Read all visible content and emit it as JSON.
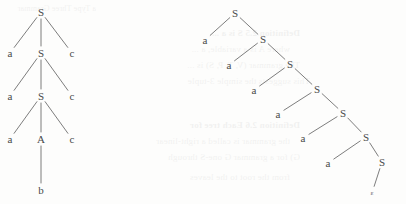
{
  "page": {
    "width": 406,
    "height": 204,
    "background_color": "#fdfdfc",
    "ink_color": "#4a4a4a",
    "stroke_color": "#6e6e6e"
  },
  "bleed_text": {
    "note": "Faint mirrored show-through text from the reverse side of the scanned page",
    "lines": [
      "a Type Three Grammar",
      "Definition 2.5  S is a ...",
      "where A is a variable, a ...",
      "The grammar (V, T, P, S) is ...",
      "This suggests the simple 3-tuple",
      "Definition 2.6  Each tree for",
      "the grammar is called a right-linear",
      "G) for a grammar G one-S through",
      "from the root to the leaves"
    ]
  },
  "figures": [
    {
      "id": "left-tree",
      "name": "ternary-parse-tree",
      "caption": "",
      "root": "S",
      "derivation": [
        "S -> a S c",
        "S -> a S c",
        "S -> a A c",
        "A -> b"
      ],
      "yield": "aaabccc",
      "nodes": [
        {
          "id": "L0",
          "label": "S",
          "x": 41,
          "y": 12,
          "kind": "nonterminal"
        },
        {
          "id": "L1a",
          "label": "a",
          "x": 10,
          "y": 53,
          "kind": "terminal"
        },
        {
          "id": "L1S",
          "label": "S",
          "x": 41,
          "y": 53,
          "kind": "nonterminal"
        },
        {
          "id": "L1c",
          "label": "c",
          "x": 72,
          "y": 53,
          "kind": "terminal"
        },
        {
          "id": "L2a",
          "label": "a",
          "x": 10,
          "y": 96,
          "kind": "terminal"
        },
        {
          "id": "L2S",
          "label": "S",
          "x": 41,
          "y": 96,
          "kind": "nonterminal"
        },
        {
          "id": "L2c",
          "label": "c",
          "x": 72,
          "y": 96,
          "kind": "terminal"
        },
        {
          "id": "L3a",
          "label": "a",
          "x": 10,
          "y": 139,
          "kind": "terminal"
        },
        {
          "id": "L3A",
          "label": "A",
          "x": 41,
          "y": 139,
          "kind": "nonterminal"
        },
        {
          "id": "L3c",
          "label": "c",
          "x": 72,
          "y": 139,
          "kind": "terminal"
        },
        {
          "id": "L4b",
          "label": "b",
          "x": 41,
          "y": 190,
          "kind": "terminal"
        }
      ],
      "edges": [
        [
          "L0",
          "L1a"
        ],
        [
          "L0",
          "L1S"
        ],
        [
          "L0",
          "L1c"
        ],
        [
          "L1S",
          "L2a"
        ],
        [
          "L1S",
          "L2S"
        ],
        [
          "L1S",
          "L2c"
        ],
        [
          "L2S",
          "L3a"
        ],
        [
          "L2S",
          "L3A"
        ],
        [
          "L2S",
          "L3c"
        ],
        [
          "L3A",
          "L4b"
        ]
      ]
    },
    {
      "id": "right-tree",
      "name": "right-linear-parse-tree",
      "caption": "",
      "root": "S",
      "derivation": [
        "S -> a S",
        "S -> a S",
        "S -> a S",
        "S -> a S",
        "S -> a S",
        "S -> a S",
        "S -> "
      ],
      "yield": "aaaaaa",
      "nodes": [
        {
          "id": "R0",
          "label": "S",
          "x": 235,
          "y": 13,
          "kind": "nonterminal"
        },
        {
          "id": "R0a",
          "label": "a",
          "x": 205,
          "y": 40,
          "kind": "terminal"
        },
        {
          "id": "R1",
          "label": "S",
          "x": 263,
          "y": 39,
          "kind": "nonterminal"
        },
        {
          "id": "R1a",
          "label": "a",
          "x": 229,
          "y": 65,
          "kind": "terminal"
        },
        {
          "id": "R2",
          "label": "S",
          "x": 290,
          "y": 64,
          "kind": "nonterminal"
        },
        {
          "id": "R2a",
          "label": "a",
          "x": 254,
          "y": 90,
          "kind": "terminal"
        },
        {
          "id": "R3",
          "label": "S",
          "x": 317,
          "y": 89,
          "kind": "nonterminal"
        },
        {
          "id": "R3a",
          "label": "a",
          "x": 278,
          "y": 114,
          "kind": "terminal"
        },
        {
          "id": "R4",
          "label": "S",
          "x": 343,
          "y": 113,
          "kind": "nonterminal"
        },
        {
          "id": "R4a",
          "label": "a",
          "x": 303,
          "y": 138,
          "kind": "terminal"
        },
        {
          "id": "R5",
          "label": "S",
          "x": 366,
          "y": 137,
          "kind": "nonterminal"
        },
        {
          "id": "R5a",
          "label": "a",
          "x": 328,
          "y": 163,
          "kind": "terminal"
        },
        {
          "id": "R6",
          "label": "S",
          "x": 382,
          "y": 162,
          "kind": "nonterminal"
        },
        {
          "id": "R6e",
          "label": "ε",
          "x": 372,
          "y": 193,
          "kind": "epsilon"
        }
      ],
      "edges": [
        [
          "R0",
          "R0a"
        ],
        [
          "R0",
          "R1"
        ],
        [
          "R1",
          "R1a"
        ],
        [
          "R1",
          "R2"
        ],
        [
          "R2",
          "R2a"
        ],
        [
          "R2",
          "R3"
        ],
        [
          "R3",
          "R3a"
        ],
        [
          "R3",
          "R4"
        ],
        [
          "R4",
          "R4a"
        ],
        [
          "R4",
          "R5"
        ],
        [
          "R5",
          "R5a"
        ],
        [
          "R5",
          "R6"
        ],
        [
          "R6",
          "R6e"
        ]
      ]
    }
  ]
}
